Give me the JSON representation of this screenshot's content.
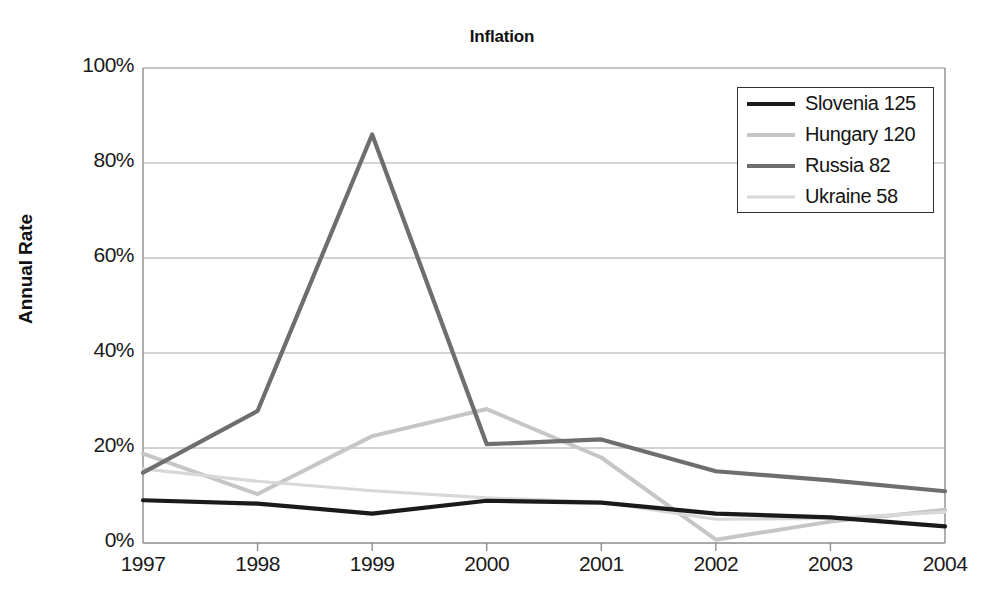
{
  "chart_data": {
    "type": "line",
    "title": "Inflation",
    "xlabel": "",
    "ylabel": "Annual Rate",
    "x": [
      1997,
      1998,
      1999,
      2000,
      2001,
      2002,
      2003,
      2004
    ],
    "xtick_labels": [
      "1997",
      "1998",
      "1999",
      "2000",
      "2001",
      "2002",
      "2003",
      "2004"
    ],
    "ytick_labels": [
      "0%",
      "20%",
      "40%",
      "60%",
      "80%",
      "100%"
    ],
    "ytick_values": [
      0,
      20,
      40,
      60,
      80,
      100
    ],
    "ylim": [
      0,
      100
    ],
    "xlim": [
      1997,
      2004
    ],
    "grid": "horizontal",
    "legend_position": "top-right",
    "series": [
      {
        "name": "Slovenia 125",
        "color": "#1a1a1a",
        "width": 4.2,
        "values": [
          9.0,
          8.3,
          6.2,
          8.9,
          8.5,
          6.2,
          5.4,
          3.5
        ]
      },
      {
        "name": "Hungary 120",
        "color": "#c6c6c6",
        "width": 4.0,
        "values": [
          18.8,
          10.3,
          22.5,
          28.2,
          18.0,
          0.7,
          4.5,
          7.0
        ]
      },
      {
        "name": "Russia 82",
        "color": "#6e6e6e",
        "width": 4.2,
        "values": [
          14.8,
          27.8,
          86.0,
          20.8,
          21.8,
          15.1,
          13.2,
          10.9
        ]
      },
      {
        "name": "Ukraine 58",
        "color": "#d8d8d8",
        "width": 3.2,
        "values": [
          15.6,
          13.0,
          11.0,
          9.5,
          8.6,
          5.0,
          5.2,
          6.5
        ]
      }
    ]
  },
  "legend": {
    "items": [
      {
        "label": "Slovenia 125"
      },
      {
        "label": "Hungary 120"
      },
      {
        "label": "Russia 82"
      },
      {
        "label": "Ukraine 58"
      }
    ]
  },
  "axes": {
    "plot_left": 143,
    "plot_right": 945,
    "plot_top": 68,
    "plot_bottom": 543,
    "frame_color": "#8c8c8c",
    "grid_color": "#a8a8a8"
  }
}
